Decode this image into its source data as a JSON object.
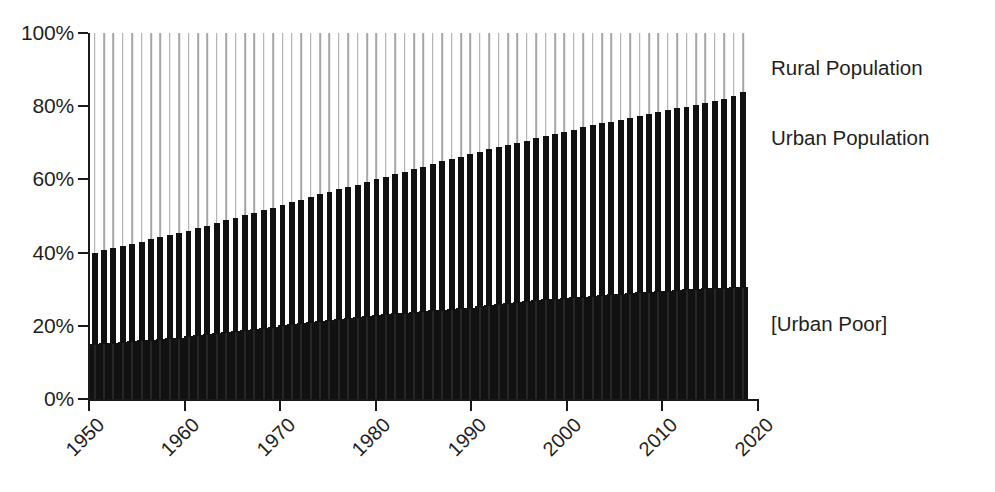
{
  "chart_data": {
    "type": "bar",
    "title": "",
    "subtitle": "",
    "xlabel": "",
    "ylabel": "",
    "stacked": true,
    "grid": false,
    "legend_position": "right-inline-annotations",
    "ylim": [
      0,
      100
    ],
    "ytick_labels": [
      "0%",
      "20%",
      "40%",
      "60%",
      "80%",
      "100%"
    ],
    "ytick_values": [
      0,
      20,
      40,
      60,
      80,
      100
    ],
    "xlim": [
      1950,
      2020
    ],
    "xtick_labels": [
      "1950",
      "1960",
      "1970",
      "1980",
      "1990",
      "2000",
      "2010",
      "2020"
    ],
    "xtick_values": [
      1950,
      1960,
      1970,
      1980,
      1990,
      2000,
      2010,
      2020
    ],
    "annotations": [
      {
        "name": "rural-population",
        "label": "Rural Population",
        "y_percent": 93
      },
      {
        "name": "urban-population",
        "label": "Urban Population",
        "y_percent": 72
      },
      {
        "name": "urban-poor",
        "label": "[Urban Poor]",
        "y_percent": 17
      }
    ],
    "colors": {
      "urban_bar": "#111111",
      "urban_poor": "#111111",
      "rural_line": "#a6a6a6",
      "axis": "#1a1a1a",
      "text": "#1f1f1f",
      "background": "#ffffff"
    },
    "x": [
      1950,
      1951,
      1952,
      1953,
      1954,
      1955,
      1956,
      1957,
      1958,
      1959,
      1960,
      1961,
      1962,
      1963,
      1964,
      1965,
      1966,
      1967,
      1968,
      1969,
      1970,
      1971,
      1972,
      1973,
      1974,
      1975,
      1976,
      1977,
      1978,
      1979,
      1980,
      1981,
      1982,
      1983,
      1984,
      1985,
      1986,
      1987,
      1988,
      1989,
      1990,
      1991,
      1992,
      1993,
      1994,
      1995,
      1996,
      1997,
      1998,
      1999,
      2000,
      2001,
      2002,
      2003,
      2004,
      2005,
      2006,
      2007,
      2008,
      2009,
      2010,
      2011,
      2012,
      2013,
      2014,
      2015,
      2016,
      2017,
      2018,
      2019
    ],
    "series": [
      {
        "name": "Urban Population",
        "values": [
          40.0,
          40.6,
          41.2,
          41.8,
          42.4,
          43.0,
          43.6,
          44.2,
          44.8,
          45.4,
          46.0,
          46.7,
          47.4,
          48.1,
          48.8,
          49.5,
          50.2,
          50.9,
          51.6,
          52.3,
          53.0,
          53.8,
          54.5,
          55.2,
          55.9,
          56.6,
          57.3,
          58.0,
          58.6,
          59.3,
          60.0,
          60.7,
          61.4,
          62.1,
          62.8,
          63.5,
          64.2,
          64.9,
          65.5,
          66.2,
          67.0,
          67.6,
          68.2,
          68.8,
          69.4,
          70.0,
          70.6,
          71.2,
          71.8,
          72.4,
          73.0,
          73.6,
          74.2,
          74.8,
          75.3,
          75.8,
          76.3,
          76.8,
          77.3,
          77.8,
          78.3,
          78.9,
          79.4,
          79.9,
          80.4,
          80.9,
          81.4,
          82.0,
          82.8,
          83.8
        ]
      },
      {
        "name": "[Urban Poor]",
        "values": [
          15.0,
          15.2,
          15.4,
          15.6,
          15.8,
          16.0,
          16.2,
          16.4,
          16.6,
          16.8,
          17.1,
          17.4,
          17.7,
          18.0,
          18.3,
          18.6,
          18.9,
          19.2,
          19.5,
          19.8,
          20.1,
          20.4,
          20.7,
          21.0,
          21.3,
          21.6,
          21.9,
          22.2,
          22.5,
          22.8,
          23.0,
          23.2,
          23.4,
          23.6,
          23.8,
          24.0,
          24.2,
          24.4,
          24.6,
          24.8,
          25.0,
          25.3,
          25.6,
          25.9,
          26.2,
          26.5,
          26.8,
          27.0,
          27.2,
          27.4,
          27.6,
          27.8,
          28.0,
          28.2,
          28.4,
          28.6,
          28.8,
          29.0,
          29.2,
          29.3,
          29.4,
          29.6,
          29.8,
          30.0,
          30.1,
          30.2,
          30.3,
          30.4,
          30.5,
          30.6
        ]
      },
      {
        "name": "Rural Population",
        "values": [
          60.0,
          59.4,
          58.8,
          58.2,
          57.6,
          57.0,
          56.4,
          55.8,
          55.2,
          54.6,
          54.0,
          53.3,
          52.6,
          51.9,
          51.2,
          50.5,
          49.8,
          49.1,
          48.4,
          47.7,
          47.0,
          46.2,
          45.5,
          44.8,
          44.1,
          43.4,
          42.7,
          42.0,
          41.4,
          40.7,
          40.0,
          39.3,
          38.6,
          37.9,
          37.2,
          36.5,
          35.8,
          35.1,
          34.5,
          33.8,
          33.0,
          32.4,
          31.8,
          31.2,
          30.6,
          30.0,
          29.4,
          28.8,
          28.2,
          27.6,
          27.0,
          26.4,
          25.8,
          25.2,
          24.7,
          24.2,
          23.7,
          23.2,
          22.7,
          22.2,
          21.7,
          21.1,
          20.6,
          20.1,
          19.6,
          19.1,
          18.6,
          18.0,
          17.2,
          16.2
        ]
      }
    ]
  }
}
